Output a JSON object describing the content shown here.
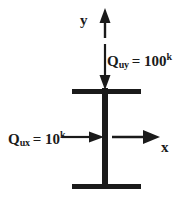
{
  "figure": {
    "background_color": "#ffffff",
    "ink_color": "#1a1a1a",
    "width": 186,
    "height": 201
  },
  "axes": {
    "y_label": "y",
    "x_label": "x",
    "y_direction": "up",
    "x_direction": "right"
  },
  "loads": [
    {
      "name": "vertical-load",
      "symbol": "Q",
      "subscript": "uy",
      "equals": "=",
      "value": "100",
      "superscript": "k",
      "text": "Qᵤᵧ = 100ᵏ",
      "direction": "down"
    },
    {
      "name": "horizontal-load",
      "symbol": "Q",
      "subscript": "ux",
      "equals": "=",
      "value": "10",
      "superscript": "k",
      "text": "Qᵤₓ = 10ᵏ",
      "direction": "right"
    }
  ],
  "member": {
    "name": "steel-column-i-section",
    "web_label": "web",
    "top_flange_label": "top flange",
    "bottom_flange_label": "bottom flange"
  }
}
